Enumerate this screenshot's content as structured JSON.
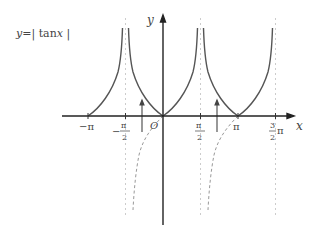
{
  "title": {
    "lhs": "y",
    "eq": "=",
    "bar_left": "|",
    "fn": "tan",
    "var": "x",
    "bar_right": "|"
  },
  "axes": {
    "x_label": "x",
    "y_label": "y",
    "origin_label": "O"
  },
  "ticks": {
    "neg_pi": "−π",
    "neg_half_pi_sign": "−",
    "neg_half_pi_num": "π",
    "neg_half_pi_den": "2",
    "half_pi_num": "π",
    "half_pi_den": "2",
    "pi": "π",
    "three_half_pi_num": "3",
    "three_half_pi_den": "2",
    "three_half_pi_sym": "π"
  },
  "colors": {
    "curve": "#555555",
    "axis": "#222222",
    "asymptote": "#cccccc",
    "dashed": "#999999"
  }
}
